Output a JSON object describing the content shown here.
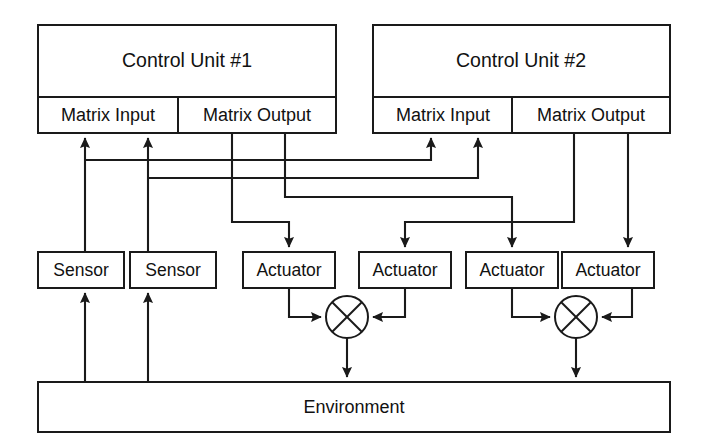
{
  "diagram": {
    "title_text_present": false,
    "background_color": "#ffffff",
    "line_color": "#1a1a1a",
    "control_units": [
      {
        "id": "control-unit-1",
        "label": "Control Unit #1",
        "ports": [
          {
            "id": "matrix-input-1",
            "label": "Matrix Input"
          },
          {
            "id": "matrix-output-1",
            "label": "Matrix Output"
          }
        ]
      },
      {
        "id": "control-unit-2",
        "label": "Control Unit #2",
        "ports": [
          {
            "id": "matrix-input-2",
            "label": "Matrix Input"
          },
          {
            "id": "matrix-output-2",
            "label": "Matrix Output"
          }
        ]
      }
    ],
    "sensors": [
      {
        "id": "sensor-1",
        "label": "Sensor"
      },
      {
        "id": "sensor-2",
        "label": "Sensor"
      }
    ],
    "actuators": [
      {
        "id": "actuator-1",
        "label": "Actuator"
      },
      {
        "id": "actuator-2",
        "label": "Actuator"
      },
      {
        "id": "actuator-3",
        "label": "Actuator"
      },
      {
        "id": "actuator-4",
        "label": "Actuator"
      }
    ],
    "mixers": [
      {
        "id": "mixer-1",
        "symbol": "crossed-circle"
      },
      {
        "id": "mixer-2",
        "symbol": "crossed-circle"
      }
    ],
    "environment": {
      "id": "environment",
      "label": "Environment"
    },
    "connections": [
      {
        "from": "environment",
        "to": "sensor-1",
        "kind": "arrow"
      },
      {
        "from": "environment",
        "to": "sensor-2",
        "kind": "arrow"
      },
      {
        "from": "sensor-1",
        "to": "matrix-input-1",
        "kind": "arrow"
      },
      {
        "from": "sensor-2",
        "to": "matrix-input-1",
        "kind": "arrow"
      },
      {
        "from": "sensor-1",
        "to": "matrix-input-2",
        "kind": "arrow"
      },
      {
        "from": "sensor-2",
        "to": "matrix-input-2",
        "kind": "arrow"
      },
      {
        "from": "matrix-output-1",
        "to": "actuator-1",
        "kind": "arrow"
      },
      {
        "from": "matrix-output-1",
        "to": "actuator-3",
        "kind": "arrow"
      },
      {
        "from": "matrix-output-2",
        "to": "actuator-2",
        "kind": "arrow"
      },
      {
        "from": "matrix-output-2",
        "to": "actuator-4",
        "kind": "arrow"
      },
      {
        "from": "actuator-1",
        "to": "mixer-1",
        "kind": "arrow"
      },
      {
        "from": "actuator-2",
        "to": "mixer-1",
        "kind": "arrow"
      },
      {
        "from": "actuator-3",
        "to": "mixer-2",
        "kind": "arrow"
      },
      {
        "from": "actuator-4",
        "to": "mixer-2",
        "kind": "arrow"
      },
      {
        "from": "mixer-1",
        "to": "environment",
        "kind": "arrow"
      },
      {
        "from": "mixer-2",
        "to": "environment",
        "kind": "arrow"
      }
    ]
  }
}
